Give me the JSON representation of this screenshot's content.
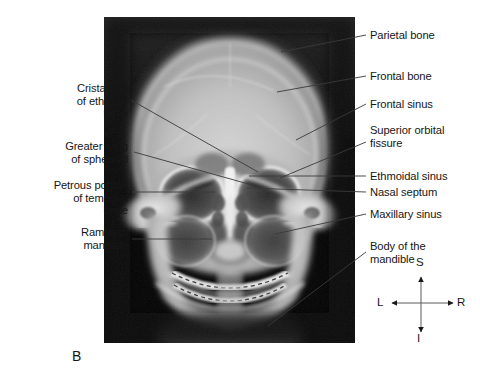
{
  "figure": {
    "panel_letter": "B",
    "modality": "radiograph",
    "view": "anteroposterior skull x-ray",
    "background_color": "#ffffff",
    "image_background_color": "#000000",
    "label_color": "#161616",
    "leader_line_color": "#3a3a3a"
  },
  "labels": {
    "left": [
      {
        "id": "crista-galli",
        "text": "Crista galli\nof ethmoid\nbone"
      },
      {
        "id": "greater-wing-sphenoid",
        "text": "Greater wing\nof sphenoid"
      },
      {
        "id": "petrous-portion-temporal",
        "text": "Petrous portion\nof temporal\nbone"
      },
      {
        "id": "ramus-of-mandible",
        "text": "Ramus of\nmandible"
      }
    ],
    "right": [
      {
        "id": "parietal-bone",
        "text": "Parietal bone"
      },
      {
        "id": "frontal-bone",
        "text": "Frontal bone"
      },
      {
        "id": "frontal-sinus",
        "text": "Frontal sinus"
      },
      {
        "id": "superior-orbital-fissure",
        "text": "Superior orbital\nfissure"
      },
      {
        "id": "ethmoidal-sinus",
        "text": "Ethmoidal sinus"
      },
      {
        "id": "nasal-septum",
        "text": "Nasal septum"
      },
      {
        "id": "maxillary-sinus",
        "text": "Maxillary sinus"
      },
      {
        "id": "body-of-mandible",
        "text": "Body of the\nmandible"
      }
    ]
  },
  "compass": {
    "superior": "S",
    "inferior": "I",
    "left": "L",
    "right": "R"
  }
}
